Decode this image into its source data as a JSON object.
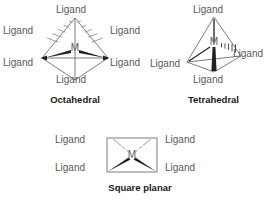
{
  "figure": {
    "title_present": false,
    "background_color": "#ffffff",
    "label_color": "#58595b",
    "caption_color": "#1a1a1a",
    "bond_color": "#231f20",
    "outline_color": "#6d6e71"
  },
  "diagrams": [
    {
      "id": "octahedral",
      "caption": "Octahedral",
      "center_atom": "M",
      "coordination_number": 6,
      "ligand_labels": [
        "Ligand",
        "Ligand",
        "Ligand",
        "Ligand",
        "Ligand",
        "Ligand"
      ],
      "ligand_positions": [
        "top",
        "upper-left",
        "upper-right",
        "lower-left",
        "lower-right",
        "bottom"
      ],
      "bond_styles": [
        "plain",
        "hashed-wedge",
        "hashed-wedge",
        "solid-wedge",
        "solid-wedge",
        "plain"
      ]
    },
    {
      "id": "tetrahedral",
      "caption": "Tetrahedral",
      "center_atom": "M",
      "coordination_number": 4,
      "ligand_labels": [
        "Ligand",
        "Ligand",
        "Ligand",
        "Ligand"
      ],
      "ligand_positions": [
        "top",
        "left",
        "right",
        "bottom"
      ],
      "bond_styles": [
        "plain",
        "plain",
        "hashed-wedge",
        "solid-wedge"
      ]
    },
    {
      "id": "square-planar",
      "caption": "Square planar",
      "center_atom": "M",
      "coordination_number": 4,
      "ligand_labels": [
        "Ligand",
        "Ligand",
        "Ligand",
        "Ligand"
      ],
      "ligand_positions": [
        "upper-left",
        "upper-right",
        "lower-left",
        "lower-right"
      ],
      "bond_styles": [
        "hashed-wedge",
        "hashed-wedge",
        "solid-wedge",
        "solid-wedge"
      ]
    }
  ]
}
